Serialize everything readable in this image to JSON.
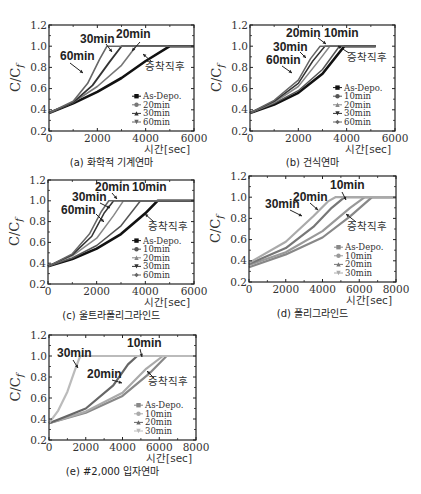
{
  "figure": {
    "y_axis_label": "C/C_f",
    "x_axis_label": "시간[sec]",
    "y_ticks": [
      "0.2",
      "0.4",
      "0.6",
      "0.8",
      "1.0",
      "1.2"
    ]
  },
  "chart_data": [
    {
      "id": "a",
      "type": "line",
      "caption": "(a) 화학적 기계연마",
      "xlabel": "시간[sec]",
      "ylabel": "C/C_f",
      "xlim": [
        0,
        6000
      ],
      "ylim": [
        0.2,
        1.2
      ],
      "x_ticks": [
        "0",
        "2000",
        "4000",
        "6000"
      ],
      "y_ticks": [
        "0.2",
        "0.4",
        "0.6",
        "0.8",
        "1.0",
        "1.2"
      ],
      "legend": [
        "As-Depo.",
        "20min",
        "30min",
        "60min"
      ],
      "annotations": [
        "60min",
        "30min",
        "20min",
        "증착직후"
      ],
      "series": [
        {
          "name": "As-Depo.",
          "color": "#111111",
          "width": 2.6,
          "x": [
            0,
            1000,
            2000,
            3000,
            4000,
            5000,
            6000
          ],
          "y": [
            0.37,
            0.46,
            0.57,
            0.7,
            0.86,
            1.0,
            1.0
          ]
        },
        {
          "name": "20min",
          "color": "#777777",
          "width": 1.6,
          "x": [
            0,
            1000,
            2000,
            3000,
            3600,
            5000,
            6000
          ],
          "y": [
            0.37,
            0.47,
            0.62,
            0.82,
            1.0,
            1.0,
            1.0
          ]
        },
        {
          "name": "30min",
          "color": "#333333",
          "width": 1.8,
          "x": [
            0,
            1000,
            1800,
            2500,
            3000,
            5000,
            6000
          ],
          "y": [
            0.37,
            0.47,
            0.63,
            0.85,
            1.0,
            1.0,
            1.0
          ]
        },
        {
          "name": "60min",
          "color": "#666666",
          "width": 1.6,
          "x": [
            0,
            1000,
            1600,
            2100,
            2400,
            5000,
            6000
          ],
          "y": [
            0.37,
            0.48,
            0.65,
            0.88,
            1.0,
            1.0,
            1.0
          ]
        }
      ]
    },
    {
      "id": "b",
      "type": "line",
      "caption": "(b) 건식연마",
      "xlabel": "시간[sec]",
      "ylabel": "C/C_f",
      "xlim": [
        0,
        6000
      ],
      "ylim": [
        0.2,
        1.2
      ],
      "x_ticks": [
        "0",
        "2000",
        "4000",
        "6000"
      ],
      "y_ticks": [
        "0.2",
        "0.4",
        "0.6",
        "0.8",
        "1.0",
        "1.2"
      ],
      "legend": [
        "As-Depo.",
        "10min",
        "20min",
        "30min",
        "60min"
      ],
      "annotations": [
        "20min",
        "10min",
        "30min",
        "60min",
        "증착직후"
      ],
      "series": [
        {
          "name": "As-Depo.",
          "color": "#111111",
          "width": 2.6,
          "x": [
            0,
            1000,
            2000,
            3000,
            3900,
            5200
          ],
          "y": [
            0.37,
            0.45,
            0.56,
            0.74,
            1.0,
            1.0
          ]
        },
        {
          "name": "10min",
          "color": "#555555",
          "width": 1.5,
          "x": [
            0,
            1000,
            2000,
            3000,
            3700,
            5200
          ],
          "y": [
            0.37,
            0.46,
            0.58,
            0.78,
            1.0,
            1.0
          ]
        },
        {
          "name": "20min",
          "color": "#888888",
          "width": 1.5,
          "x": [
            0,
            1000,
            2000,
            2800,
            3300,
            5200
          ],
          "y": [
            0.37,
            0.47,
            0.62,
            0.85,
            1.0,
            1.0
          ]
        },
        {
          "name": "30min",
          "color": "#333333",
          "width": 1.5,
          "x": [
            0,
            1000,
            2000,
            2600,
            3100,
            5200
          ],
          "y": [
            0.37,
            0.48,
            0.65,
            0.86,
            1.0,
            1.0
          ]
        },
        {
          "name": "60min",
          "color": "#666666",
          "width": 1.5,
          "x": [
            0,
            1000,
            2000,
            2500,
            2900,
            5200
          ],
          "y": [
            0.37,
            0.49,
            0.68,
            0.88,
            1.0,
            1.0
          ]
        }
      ]
    },
    {
      "id": "c",
      "type": "line",
      "caption": "(c) 울트라폴리그라인드",
      "xlabel": "시간[sec]",
      "ylabel": "C/C_f",
      "xlim": [
        0,
        6000
      ],
      "ylim": [
        0.2,
        1.2
      ],
      "x_ticks": [
        "0",
        "2000",
        "4000",
        "6000"
      ],
      "y_ticks": [
        "0.2",
        "0.4",
        "0.6",
        "0.8",
        "1.0",
        "1.2"
      ],
      "legend": [
        "As-Depo.",
        "10min",
        "20min",
        "30min",
        "60min"
      ],
      "annotations": [
        "20min",
        "10min",
        "30min",
        "60min",
        "증착직후"
      ],
      "series": [
        {
          "name": "As-Depo.",
          "color": "#111111",
          "width": 2.6,
          "x": [
            0,
            1000,
            2000,
            3000,
            4000,
            4500,
            6000
          ],
          "y": [
            0.37,
            0.44,
            0.54,
            0.68,
            0.88,
            1.0,
            1.0
          ]
        },
        {
          "name": "10min",
          "color": "#555555",
          "width": 1.5,
          "x": [
            0,
            1000,
            2000,
            3000,
            3800,
            6000
          ],
          "y": [
            0.37,
            0.45,
            0.57,
            0.76,
            1.0,
            1.0
          ]
        },
        {
          "name": "20min",
          "color": "#888888",
          "width": 1.5,
          "x": [
            0,
            1000,
            2000,
            2700,
            3100,
            6000
          ],
          "y": [
            0.37,
            0.47,
            0.64,
            0.86,
            1.0,
            1.0
          ]
        },
        {
          "name": "30min",
          "color": "#333333",
          "width": 1.5,
          "x": [
            0,
            1000,
            1800,
            2300,
            2700,
            6000
          ],
          "y": [
            0.37,
            0.48,
            0.66,
            0.88,
            1.0,
            1.0
          ]
        },
        {
          "name": "60min",
          "color": "#666666",
          "width": 1.5,
          "x": [
            0,
            1000,
            1700,
            2200,
            2500,
            6000
          ],
          "y": [
            0.37,
            0.49,
            0.68,
            0.9,
            1.0,
            1.0
          ]
        }
      ]
    },
    {
      "id": "d",
      "type": "line",
      "caption": "(d) 폴리그라인드",
      "xlabel": "시간[sec]",
      "ylabel": "C/C_f",
      "xlim": [
        0,
        8000
      ],
      "ylim": [
        0.2,
        1.2
      ],
      "x_ticks": [
        "0",
        "2000",
        "4000",
        "6000",
        "8000"
      ],
      "y_ticks": [
        "0.2",
        "0.4",
        "0.6",
        "0.8",
        "1.0",
        "1.2"
      ],
      "legend": [
        "As-Depo.",
        "10min",
        "20min",
        "30min"
      ],
      "annotations": [
        "10min",
        "20min",
        "30min",
        "증착직후"
      ],
      "series": [
        {
          "name": "As-Depo.",
          "color": "#888888",
          "width": 2.2,
          "x": [
            0,
            2000,
            4000,
            5500,
            6700,
            8000
          ],
          "y": [
            0.34,
            0.46,
            0.62,
            0.82,
            1.0,
            1.0
          ]
        },
        {
          "name": "10min",
          "color": "#999999",
          "width": 2.2,
          "x": [
            0,
            2000,
            4000,
            5500,
            6300,
            8000
          ],
          "y": [
            0.36,
            0.48,
            0.68,
            0.9,
            1.0,
            1.0
          ]
        },
        {
          "name": "20min",
          "color": "#777777",
          "width": 2.2,
          "x": [
            0,
            2000,
            3500,
            4500,
            5200,
            8000
          ],
          "y": [
            0.37,
            0.52,
            0.72,
            0.9,
            1.0,
            1.0
          ]
        },
        {
          "name": "30min",
          "color": "#aaaaaa",
          "width": 2.2,
          "x": [
            0,
            2000,
            3500,
            4300,
            4700,
            8000
          ],
          "y": [
            0.38,
            0.58,
            0.82,
            0.96,
            1.0,
            1.0
          ]
        }
      ]
    },
    {
      "id": "e",
      "type": "line",
      "caption": "(e) #2,000 입자연마",
      "xlabel": "시간[sec]",
      "ylabel": "C/C_f",
      "xlim": [
        0,
        8000
      ],
      "ylim": [
        0.2,
        1.2
      ],
      "x_ticks": [
        "0",
        "2000",
        "4000",
        "6000",
        "8000"
      ],
      "y_ticks": [
        "0.2",
        "0.4",
        "0.6",
        "0.8",
        "1.0",
        "1.2"
      ],
      "legend": [
        "As-Depo.",
        "10min",
        "20min",
        "30min"
      ],
      "annotations": [
        "30min",
        "10min",
        "20min",
        "증착직후"
      ],
      "series": [
        {
          "name": "As-Depo.",
          "color": "#888888",
          "width": 2.2,
          "x": [
            0,
            2000,
            4000,
            5500,
            6400,
            8000
          ],
          "y": [
            0.36,
            0.46,
            0.62,
            0.84,
            1.0,
            1.0
          ]
        },
        {
          "name": "10min",
          "color": "#aaaaaa",
          "width": 2.2,
          "x": [
            0,
            2000,
            4000,
            5300,
            6200,
            8000
          ],
          "y": [
            0.36,
            0.47,
            0.65,
            0.88,
            1.0,
            1.0
          ]
        },
        {
          "name": "20min",
          "color": "#666666",
          "width": 2.2,
          "x": [
            0,
            2000,
            3500,
            4300,
            4800,
            8000
          ],
          "y": [
            0.36,
            0.5,
            0.72,
            0.92,
            1.0,
            1.0
          ]
        },
        {
          "name": "30min",
          "color": "#bbbbbb",
          "width": 2.2,
          "x": [
            0,
            500,
            1000,
            1400,
            1700,
            8000
          ],
          "y": [
            0.36,
            0.48,
            0.66,
            0.86,
            1.0,
            1.0
          ]
        }
      ]
    }
  ],
  "panels_layout": [
    {
      "id": "a",
      "x0": 49,
      "x1": 194,
      "y_top": 25,
      "y_bot": 131
    },
    {
      "id": "b",
      "x0": 250,
      "x1": 395,
      "y_top": 25,
      "y_bot": 131
    },
    {
      "id": "c",
      "x0": 48,
      "x1": 194,
      "y_top": 180,
      "y_bot": 284
    },
    {
      "id": "d",
      "x0": 249,
      "x1": 396,
      "y_top": 176,
      "y_bot": 282
    },
    {
      "id": "e",
      "x0": 49,
      "x1": 196,
      "y_top": 335,
      "y_bot": 440
    }
  ],
  "labels": {
    "a": [
      {
        "text": "30min",
        "x": 80,
        "y": 43,
        "cls": "ann"
      },
      {
        "text": "20min",
        "x": 116,
        "y": 38,
        "cls": "ann"
      },
      {
        "text": "60min",
        "x": 60,
        "y": 60,
        "cls": "ann"
      },
      {
        "text": "증착직후",
        "x": 145,
        "y": 70,
        "cls": "ann2"
      }
    ],
    "b": [
      {
        "text": "20min",
        "x": 286,
        "y": 37,
        "cls": "ann"
      },
      {
        "text": "10min",
        "x": 324,
        "y": 37,
        "cls": "ann"
      },
      {
        "text": "30min",
        "x": 273,
        "y": 51,
        "cls": "ann"
      },
      {
        "text": "60min",
        "x": 266,
        "y": 64,
        "cls": "ann"
      },
      {
        "text": "증착직후",
        "x": 347,
        "y": 61,
        "cls": "ann2"
      }
    ],
    "c": [
      {
        "text": "20min",
        "x": 95,
        "y": 191,
        "cls": "ann"
      },
      {
        "text": "10min",
        "x": 132,
        "y": 191,
        "cls": "ann"
      },
      {
        "text": "30min",
        "x": 72,
        "y": 201,
        "cls": "ann"
      },
      {
        "text": "60min",
        "x": 61,
        "y": 214,
        "cls": "ann"
      },
      {
        "text": "증착직후",
        "x": 148,
        "y": 230,
        "cls": "ann2"
      }
    ],
    "d": [
      {
        "text": "10min",
        "x": 330,
        "y": 189,
        "cls": "ann"
      },
      {
        "text": "20min",
        "x": 293,
        "y": 201,
        "cls": "ann"
      },
      {
        "text": "30min",
        "x": 265,
        "y": 208,
        "cls": "ann"
      },
      {
        "text": "증착직후",
        "x": 347,
        "y": 230,
        "cls": "ann2"
      }
    ],
    "e": [
      {
        "text": "30min",
        "x": 57,
        "y": 357,
        "cls": "ann"
      },
      {
        "text": "10min",
        "x": 127,
        "y": 347,
        "cls": "ann"
      },
      {
        "text": "20min",
        "x": 87,
        "y": 378,
        "cls": "ann"
      },
      {
        "text": "증착직후",
        "x": 148,
        "y": 385,
        "cls": "ann2"
      }
    ]
  }
}
